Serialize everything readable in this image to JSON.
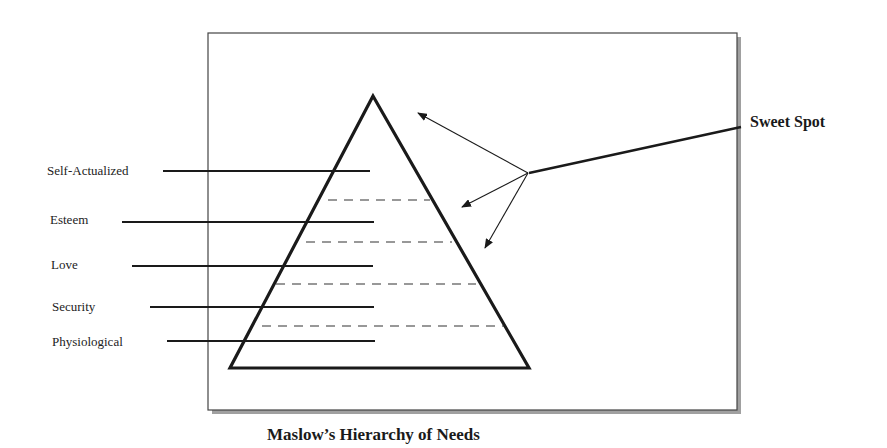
{
  "diagram": {
    "title": "Maslow’s Hierarchy of Needs",
    "callout": "Sweet Spot",
    "levels": [
      {
        "label": "Self-Actualized"
      },
      {
        "label": "Esteem"
      },
      {
        "label": "Love"
      },
      {
        "label": "Security"
      },
      {
        "label": "Physiological"
      }
    ],
    "colors": {
      "line": "#1a1a1a",
      "frame": "#444444",
      "shadow": "#9a9a9a",
      "background": "#ffffff"
    }
  }
}
